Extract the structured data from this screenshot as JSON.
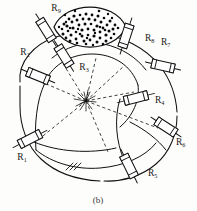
{
  "figure": {
    "caption": "(b)",
    "type": "schematic-diagram",
    "colors": {
      "line": "#111111",
      "background": "#fdfdfc",
      "speckle": "#0a0a0a",
      "label": "#1a1a1a"
    },
    "center_point": {
      "x": 86,
      "y": 101
    }
  },
  "labels": [
    {
      "id": "R9",
      "base": "R",
      "sub": "9",
      "x": 56,
      "y": 11,
      "anchor": "middle"
    },
    {
      "id": "R8",
      "base": "R",
      "sub": "8",
      "x": 145,
      "y": 41,
      "anchor": "start"
    },
    {
      "id": "R7",
      "base": "R",
      "sub": "7",
      "x": 161,
      "y": 45,
      "anchor": "start"
    },
    {
      "id": "R2",
      "base": "R",
      "sub": "2",
      "x": 25,
      "y": 55,
      "anchor": "middle"
    },
    {
      "id": "R3",
      "base": "R",
      "sub": "3",
      "x": 84,
      "y": 70,
      "anchor": "middle"
    },
    {
      "id": "R4",
      "base": "R",
      "sub": "4",
      "x": 155,
      "y": 103,
      "anchor": "start"
    },
    {
      "id": "R6",
      "base": "R",
      "sub": "6",
      "x": 176,
      "y": 145,
      "anchor": "start"
    },
    {
      "id": "R1",
      "base": "R",
      "sub": "1",
      "x": 22,
      "y": 160,
      "anchor": "middle"
    },
    {
      "id": "R5",
      "base": "R",
      "sub": "5",
      "x": 148,
      "y": 176,
      "anchor": "start"
    }
  ],
  "resistors": [
    {
      "id": "R9",
      "cx": 46,
      "cy": 30,
      "angle": 58,
      "len": 25,
      "w": 9
    },
    {
      "id": "R9b",
      "cx": 64,
      "cy": 55,
      "angle": 58,
      "len": 24,
      "w": 9
    },
    {
      "id": "R8",
      "cx": 126,
      "cy": 35,
      "angle": 108,
      "len": 25,
      "w": 9
    },
    {
      "id": "R7",
      "cx": 162,
      "cy": 66,
      "angle": 13,
      "len": 24,
      "w": 9
    },
    {
      "id": "R2",
      "cx": 38,
      "cy": 75,
      "angle": 22,
      "len": 24,
      "w": 9
    },
    {
      "id": "R4",
      "cx": 135,
      "cy": 98,
      "angle": -14,
      "len": 25,
      "w": 9
    },
    {
      "id": "R6",
      "cx": 166,
      "cy": 127,
      "angle": 33,
      "len": 24,
      "w": 9
    },
    {
      "id": "R1",
      "cx": 30,
      "cy": 138,
      "angle": -27,
      "len": 25,
      "w": 9
    },
    {
      "id": "R5",
      "cx": 129,
      "cy": 166,
      "angle": 64,
      "len": 25,
      "w": 9
    }
  ],
  "lens": {
    "cx": 90,
    "cy": 27,
    "rx": 36,
    "ry": 14,
    "speckle_count": 78
  },
  "radial_lines": {
    "count": 8,
    "style": "dashed",
    "origin": {
      "x": 86,
      "y": 101
    }
  }
}
